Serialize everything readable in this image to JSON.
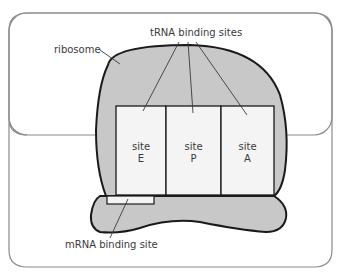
{
  "diagram": {
    "labels": {
      "ribosome": "ribosome",
      "trna": "tRNA binding sites",
      "mrna": "mRNA binding site"
    },
    "sites": [
      {
        "line1": "site",
        "line2": "E"
      },
      {
        "line1": "site",
        "line2": "P"
      },
      {
        "line1": "site",
        "line2": "A"
      }
    ],
    "colors": {
      "ribosome_fill": "#c8c8c8",
      "site_fill": "#f4f4f4",
      "outline": "#1a1a1a",
      "frame_border": "#8a8a8a",
      "text": "#3a3a3a"
    }
  }
}
